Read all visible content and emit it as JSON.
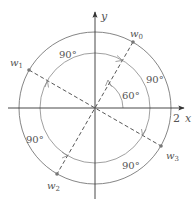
{
  "diagram": {
    "axes": {
      "x_label": "x",
      "y_label": "y",
      "x_tick_label": "2"
    },
    "points": [
      {
        "name": "w0",
        "base": "w",
        "sub": "0",
        "angle_deg": 60
      },
      {
        "name": "w1",
        "base": "w",
        "sub": "1",
        "angle_deg": 150
      },
      {
        "name": "w2",
        "base": "w",
        "sub": "2",
        "angle_deg": 240
      },
      {
        "name": "w3",
        "base": "w",
        "sub": "3",
        "angle_deg": 330
      }
    ],
    "angle_labels": {
      "initial": "60°",
      "arc_0_1": "90°",
      "arc_1_2": "90°",
      "arc_2_3": "90°",
      "arc_3_0": "90°"
    },
    "radius": 2,
    "colors": {
      "line": "#555555",
      "circle": "#777777",
      "point": "#777777",
      "background": "#ffffff"
    }
  }
}
